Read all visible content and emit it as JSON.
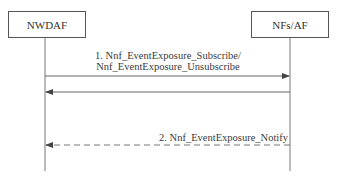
{
  "diagram": {
    "type": "sequence",
    "actors": [
      {
        "id": "nwdaf",
        "label": "NWDAF"
      },
      {
        "id": "nfs_af",
        "label": "NFs/AF"
      }
    ],
    "messages": [
      {
        "from": "nwdaf",
        "to": "nfs_af",
        "style": "solid",
        "label_line1": "1. Nnf_EventExposure_Subscribe/",
        "label_line2": "Nnf_EventExposure_Unsubscribe"
      },
      {
        "from": "nfs_af",
        "to": "nwdaf",
        "style": "solid",
        "label": ""
      },
      {
        "from": "nfs_af",
        "to": "nwdaf",
        "style": "dashed",
        "label": "2. Nnf_EventExposure_Notify"
      }
    ],
    "colors": {
      "line": "#666666",
      "box_border": "#555555",
      "text": "#3a3a3a"
    }
  }
}
